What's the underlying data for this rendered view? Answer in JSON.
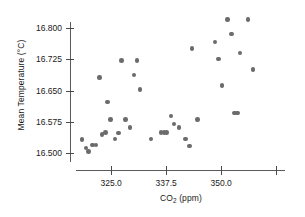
{
  "chart_data": {
    "type": "scatter",
    "title": "",
    "xlabel": "CO2 (ppm)",
    "ylabel": "Mean Temperature (°C)",
    "xlabel_parts": {
      "pre": "CO",
      "sub": "2",
      "post": " (ppm)"
    },
    "xlim": [
      317.0,
      364.5
    ],
    "ylim": [
      16.485,
      16.838
    ],
    "grid": false,
    "legend": null,
    "marker_color": "#6b6b6b",
    "axis_color": "#5b5b5b",
    "xticks": [
      325.0,
      337.5,
      350.0,
      362.5
    ],
    "xtick_labels": [
      "325.0",
      "337.5",
      "350.0",
      ""
    ],
    "yticks": [
      16.5,
      16.575,
      16.65,
      16.725,
      16.8
    ],
    "ytick_labels": [
      "16.500",
      "16.575",
      "16.650",
      "16.725",
      "16.800"
    ],
    "points": [
      {
        "x": 318.4,
        "y": 16.533
      },
      {
        "x": 319.3,
        "y": 16.512
      },
      {
        "x": 319.9,
        "y": 16.503
      },
      {
        "x": 320.7,
        "y": 16.519
      },
      {
        "x": 321.5,
        "y": 16.519
      },
      {
        "x": 322.3,
        "y": 16.681
      },
      {
        "x": 322.9,
        "y": 16.545
      },
      {
        "x": 323.7,
        "y": 16.549
      },
      {
        "x": 324.2,
        "y": 16.622
      },
      {
        "x": 324.9,
        "y": 16.581
      },
      {
        "x": 325.9,
        "y": 16.534
      },
      {
        "x": 326.6,
        "y": 16.548
      },
      {
        "x": 327.4,
        "y": 16.722
      },
      {
        "x": 328.2,
        "y": 16.581
      },
      {
        "x": 329.3,
        "y": 16.561
      },
      {
        "x": 330.2,
        "y": 16.687
      },
      {
        "x": 330.9,
        "y": 16.722
      },
      {
        "x": 331.5,
        "y": 16.652
      },
      {
        "x": 334.0,
        "y": 16.534
      },
      {
        "x": 336.3,
        "y": 16.549
      },
      {
        "x": 337.0,
        "y": 16.549
      },
      {
        "x": 337.6,
        "y": 16.549
      },
      {
        "x": 338.6,
        "y": 16.589
      },
      {
        "x": 339.3,
        "y": 16.57
      },
      {
        "x": 340.4,
        "y": 16.561
      },
      {
        "x": 341.9,
        "y": 16.534
      },
      {
        "x": 342.8,
        "y": 16.517
      },
      {
        "x": 343.4,
        "y": 16.751
      },
      {
        "x": 344.6,
        "y": 16.581
      },
      {
        "x": 348.6,
        "y": 16.766
      },
      {
        "x": 349.4,
        "y": 16.726
      },
      {
        "x": 350.2,
        "y": 16.662
      },
      {
        "x": 351.4,
        "y": 16.82
      },
      {
        "x": 352.3,
        "y": 16.786
      },
      {
        "x": 353.0,
        "y": 16.596
      },
      {
        "x": 353.7,
        "y": 16.596
      },
      {
        "x": 354.3,
        "y": 16.74
      },
      {
        "x": 356.1,
        "y": 16.82
      },
      {
        "x": 357.2,
        "y": 16.701
      }
    ]
  }
}
